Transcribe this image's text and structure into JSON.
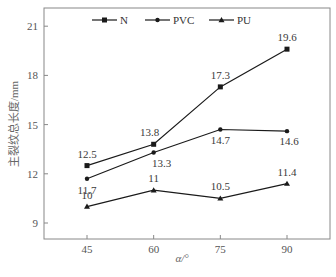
{
  "chart_data": {
    "type": "line",
    "title": "",
    "xlabel": "α/°",
    "ylabel": "主裂纹总长度/mm",
    "x": [
      45,
      60,
      75,
      90
    ],
    "xticks": [
      "45",
      "60",
      "75",
      "90"
    ],
    "yticks": [
      "9",
      "12",
      "15",
      "18",
      "21"
    ],
    "ylim": [
      8,
      22
    ],
    "grid": false,
    "legend_position": "top-inside",
    "series": [
      {
        "name": "N",
        "marker": "square",
        "values": [
          12.5,
          13.8,
          17.3,
          19.6
        ],
        "labels": [
          "12.5",
          "13.8",
          "17.3",
          "19.6"
        ]
      },
      {
        "name": "PVC",
        "marker": "circle",
        "values": [
          11.7,
          13.3,
          14.7,
          14.6
        ],
        "labels": [
          "11.7",
          "13.3",
          "14.7",
          "14.6"
        ]
      },
      {
        "name": "PU",
        "marker": "triangle",
        "values": [
          10,
          11,
          10.5,
          11.4
        ],
        "labels": [
          "10",
          "11",
          "10.5",
          "11.4"
        ]
      }
    ]
  },
  "legend": {
    "items": [
      "N",
      "PVC",
      "PU"
    ]
  },
  "axes": {
    "xlabel": "α/°",
    "ylabel": "主裂纹总长度/mm"
  },
  "colors": {
    "line": "#1a1a1a",
    "frame": "#777777",
    "text": "#555555"
  }
}
